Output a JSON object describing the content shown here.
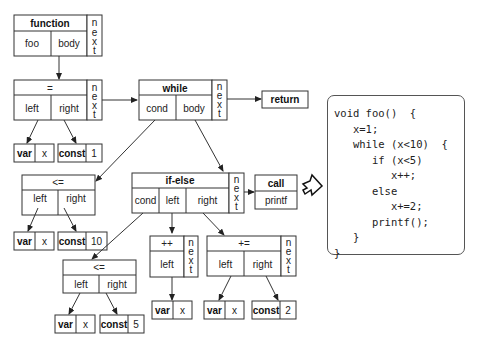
{
  "diagram": {
    "nodes": {
      "function": {
        "title": "function",
        "cells": [
          "foo",
          "body"
        ],
        "next": "n e x t"
      },
      "assign": {
        "title": "=",
        "cells": [
          "left",
          "right"
        ],
        "next": "n e x t"
      },
      "assign_var": {
        "kind": "var",
        "value": "x"
      },
      "assign_const": {
        "kind": "const",
        "value": "1"
      },
      "while": {
        "title": "while",
        "cells": [
          "cond",
          "body"
        ],
        "next": "n e x t"
      },
      "return": {
        "title": "return"
      },
      "le10": {
        "title": "<=",
        "cells": [
          "left",
          "right"
        ]
      },
      "le10_var": {
        "kind": "var",
        "value": "x"
      },
      "le10_const": {
        "kind": "const",
        "value": "10"
      },
      "ifelse": {
        "title": "if-else",
        "cells": [
          "cond",
          "left",
          "right"
        ],
        "next": "n e x t"
      },
      "call": {
        "title": "call",
        "cells": [
          "printf"
        ]
      },
      "le5": {
        "title": "<=",
        "cells": [
          "left",
          "right"
        ]
      },
      "le5_var": {
        "kind": "var",
        "value": "x"
      },
      "le5_const": {
        "kind": "const",
        "value": "5"
      },
      "inc": {
        "title": "++",
        "cells": [
          "left"
        ],
        "next": "n e x t"
      },
      "inc_var": {
        "kind": "var",
        "value": "x"
      },
      "pluseq": {
        "title": "+=",
        "cells": [
          "left",
          "right"
        ],
        "next": "n e x t"
      },
      "pluseq_var": {
        "kind": "var",
        "value": "x"
      },
      "pluseq_const": {
        "kind": "const",
        "value": "2"
      }
    },
    "next_letters": [
      "n",
      "e",
      "x",
      "t"
    ],
    "code_lines": [
      "void foo()  {",
      "   x=1;",
      "   while (x<10)  {",
      "      if (x<5)",
      "         x++;",
      "      else",
      "         x+=2;",
      "      printf();",
      "   }",
      "}"
    ]
  }
}
